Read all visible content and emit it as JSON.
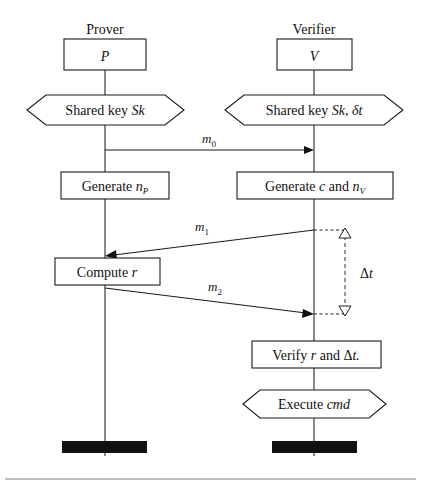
{
  "figure": {
    "type": "sequence-diagram",
    "background_color": "#ffffff",
    "line_color": "#1a1a1a",
    "text_color": "#111111"
  },
  "lanes": [
    {
      "id": "prover",
      "role_title": "Prover",
      "actor_box_label": "P",
      "lifeline_x": 105
    },
    {
      "id": "verifier",
      "role_title": "Verifier",
      "actor_box_label": "V",
      "lifeline_x": 314
    }
  ],
  "nodes": [
    {
      "id": "prover-actor",
      "lane": "prover",
      "shape": "rect",
      "text": "P",
      "italic": true
    },
    {
      "id": "verifier-actor",
      "lane": "verifier",
      "shape": "rect",
      "text": "V",
      "italic": true
    },
    {
      "id": "prover-shared-key",
      "lane": "prover",
      "shape": "hexagon",
      "text_plain": "Shared key Sk",
      "text_normal": "Shared key ",
      "text_italic": "Sk"
    },
    {
      "id": "verifier-shared-key",
      "lane": "verifier",
      "shape": "hexagon",
      "text_plain": "Shared key Sk, δt",
      "text_normal": "Shared key ",
      "text_italic": "Sk, δt"
    },
    {
      "id": "prover-generate-np",
      "lane": "prover",
      "shape": "rect",
      "text_plain": "Generate nP",
      "text_normal": "Generate ",
      "text_italic": "n",
      "text_subscript": "P"
    },
    {
      "id": "verifier-generate-c-nv",
      "lane": "verifier",
      "shape": "rect",
      "text_plain": "Generate c and nV",
      "text_normal_1": "Generate ",
      "text_italic_1": "c",
      "text_normal_2": " and ",
      "text_italic_2": "n",
      "text_subscript": "V"
    },
    {
      "id": "prover-compute-r",
      "lane": "prover",
      "shape": "rect",
      "text_plain": "Compute r",
      "text_normal": "Compute ",
      "text_italic": "r"
    },
    {
      "id": "verifier-verify",
      "lane": "verifier",
      "shape": "rect",
      "text_plain": "Verify r and Δt.",
      "text_normal_1": "Verify ",
      "text_italic_1": "r",
      "text_normal_2": " and Δ",
      "text_italic_2": "t."
    },
    {
      "id": "verifier-execute-cmd",
      "lane": "verifier",
      "shape": "hexagon",
      "text_plain": "Execute cmd",
      "text_normal": "Execute ",
      "text_italic": "cmd"
    }
  ],
  "messages": [
    {
      "id": "m0",
      "label": "m",
      "subscript": "0",
      "label_plain": "m0",
      "from": "prover",
      "to": "verifier",
      "direction": "right",
      "style": "solid-horizontal"
    },
    {
      "id": "m1",
      "label": "m",
      "subscript": "1",
      "label_plain": "m1",
      "from": "verifier",
      "to": "prover",
      "direction": "left",
      "style": "solid-slanted"
    },
    {
      "id": "m2",
      "label": "m",
      "subscript": "2",
      "label_plain": "m2",
      "from": "prover",
      "to": "verifier",
      "direction": "right",
      "style": "solid-slanted"
    }
  ],
  "measurement": {
    "id": "delta-t",
    "label_delta": "Δ",
    "label_var": "t",
    "label_plain": "Δt",
    "style": "dashed-vertical-with-open-triangles",
    "lane": "verifier",
    "spans_from_message": "m1",
    "spans_to_message": "m2"
  },
  "terminators": [
    {
      "id": "prover-terminator",
      "lane": "prover",
      "style": "filled-bar"
    },
    {
      "id": "verifier-terminator",
      "lane": "verifier",
      "style": "filled-bar"
    }
  ],
  "footer": {
    "rule": true
  }
}
